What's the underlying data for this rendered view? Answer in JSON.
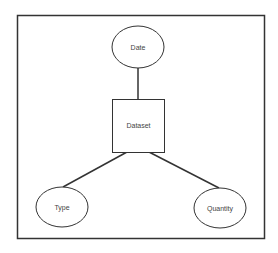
{
  "diagram": {
    "type": "entity-attribute",
    "frame": {
      "x": 17,
      "y": 15,
      "width": 247,
      "height": 223,
      "stroke": "#333333"
    },
    "nodes": [
      {
        "id": "date",
        "shape": "ellipse",
        "label": "Date",
        "cx": 138,
        "cy": 47,
        "rx": 26,
        "ry": 21
      },
      {
        "id": "dataset",
        "shape": "rect",
        "label": "Dataset",
        "x": 112,
        "y": 99,
        "width": 52,
        "height": 53
      },
      {
        "id": "type",
        "shape": "ellipse",
        "label": "Type",
        "cx": 62,
        "cy": 207,
        "rx": 26,
        "ry": 20
      },
      {
        "id": "quantity",
        "shape": "ellipse",
        "label": "Quantity",
        "cx": 220,
        "cy": 208,
        "rx": 26,
        "ry": 20
      }
    ],
    "edges": [
      {
        "from": "date",
        "to": "dataset",
        "x1": 138,
        "y1": 68,
        "x2": 138,
        "y2": 99
      },
      {
        "from": "dataset",
        "to": "type",
        "x1": 127,
        "y1": 152,
        "x2": 63,
        "y2": 187
      },
      {
        "from": "dataset",
        "to": "quantity",
        "x1": 149,
        "y1": 152,
        "x2": 219,
        "y2": 188
      }
    ],
    "line_color": "#333333"
  }
}
